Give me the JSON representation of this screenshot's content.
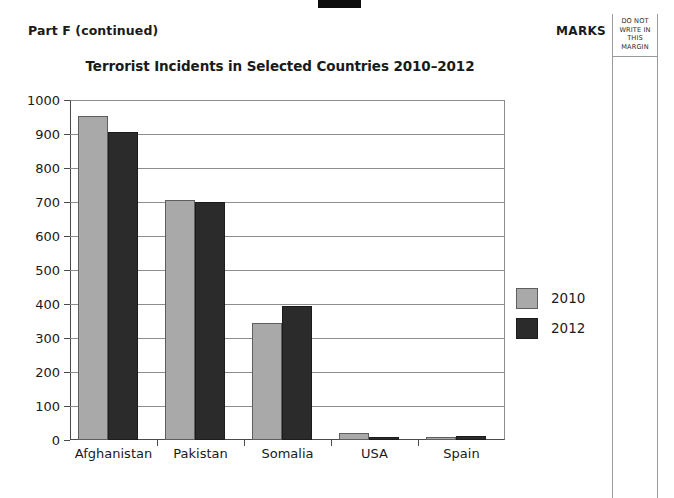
{
  "page": {
    "part_label": "Part F (continued)",
    "marks_label": "MARKS",
    "margin_notice": "DO NOT WRITE IN THIS MARGIN"
  },
  "chart_data": {
    "type": "bar",
    "title": "Terrorist Incidents in Selected Countries 2010–2012",
    "xlabel": "",
    "ylabel": "",
    "ylim": [
      0,
      1000
    ],
    "ytick_step": 100,
    "ytick_labels": [
      "1000",
      "900",
      "800",
      "700",
      "600",
      "500",
      "400",
      "300",
      "200",
      "100",
      "0"
    ],
    "grid": true,
    "legend_position": "right",
    "categories": [
      "Afghanistan",
      "Pakistan",
      "Somalia",
      "USA",
      "Spain"
    ],
    "series": [
      {
        "name": "2010",
        "color": "#a9a9a9",
        "values": [
          953,
          705,
          345,
          20,
          8
        ]
      },
      {
        "name": "2012",
        "color": "#2b2b2b",
        "values": [
          907,
          700,
          393,
          10,
          13
        ]
      }
    ]
  }
}
